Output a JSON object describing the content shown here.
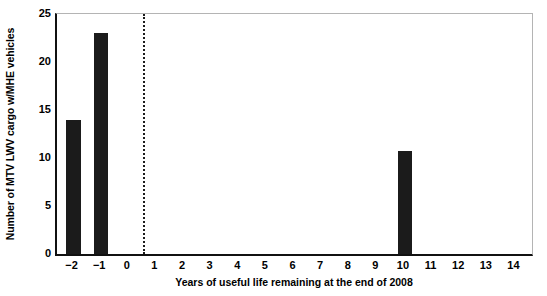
{
  "chart_data": {
    "type": "bar",
    "title": "",
    "xlabel": "Years of useful life remaining at the end of 2008",
    "ylabel": "Number of MTV LWV cargo w/MHE vehicles",
    "categories": [
      -2,
      -1,
      0,
      1,
      2,
      3,
      4,
      5,
      6,
      7,
      8,
      9,
      10,
      11,
      12,
      13,
      14
    ],
    "values": [
      14,
      23,
      0,
      0,
      0,
      0,
      0,
      0,
      0,
      0,
      0,
      0,
      10.7,
      0,
      0,
      0,
      0
    ],
    "xlim": [
      -2.6,
      14.6
    ],
    "ylim": [
      0,
      25
    ],
    "yticks": [
      0,
      5,
      10,
      15,
      20,
      25
    ],
    "ytick_labels": [
      "0",
      "5",
      "10",
      "15",
      "20",
      "25"
    ],
    "xtick_labels": [
      "−2",
      "−1",
      "0",
      "1",
      "2",
      "3",
      "4",
      "5",
      "6",
      "7",
      "8",
      "9",
      "10",
      "11",
      "12",
      "13",
      "14"
    ],
    "grid": false,
    "legend": null,
    "bar_color": "#1b1b1b",
    "annotations": [
      {
        "type": "vertical-dashed-line",
        "x": 0.5,
        "color": "#1b1b1b",
        "style": "dotted",
        "label": ""
      }
    ],
    "axis_colors": {
      "left_spine": "#111111",
      "bottom_spine": "#111111",
      "top_spine": "#b4b4b4",
      "right_spine": "#b4b4b4",
      "tick_mark": "#5a5a5a"
    }
  }
}
